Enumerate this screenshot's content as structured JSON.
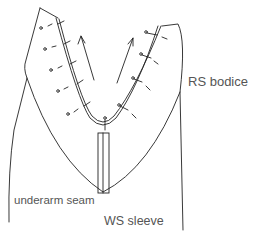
{
  "diagram": {
    "labels": {
      "rs_bodice": "RS bodice",
      "underarm_seam": "underarm seam",
      "ws_sleeve": "WS sleeve"
    },
    "elements": [
      "bodice outline",
      "sleeve outline",
      "armhole seam (double line)",
      "pins along armhole",
      "underarm seam (narrow rectangle)",
      "direction arrows"
    ],
    "colors": {
      "stroke": "#222222",
      "label": "#555555",
      "background": "#ffffff"
    }
  }
}
